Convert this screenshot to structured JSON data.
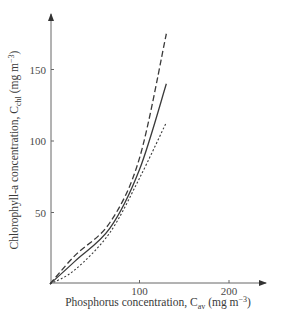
{
  "chart_data": {
    "type": "line",
    "title": "",
    "xlabel": "Phosphorus concentration, C_av (mg m^-3)",
    "ylabel": "Chlorophyll-a concentration, C_chl (mg m^-3)",
    "xlabel_parts": {
      "main": "Phosphorus concentration, C",
      "sub": "av",
      "unit_pre": " (mg m",
      "sup": "−3",
      "unit_post": ")"
    },
    "ylabel_parts": {
      "main": "Chlorophyll-a concentration, C",
      "sub": "chl",
      "unit_pre": " (mg m",
      "sup": "−3",
      "unit_post": ")"
    },
    "xlim": [
      0,
      240
    ],
    "ylim": [
      0,
      190
    ],
    "xticks": [
      100,
      200
    ],
    "yticks": [
      50,
      100,
      150
    ],
    "grid": false,
    "legend": null,
    "x": [
      0,
      28,
      67,
      100,
      130
    ],
    "series": [
      {
        "name": "upper (dashed)",
        "style": "dashed",
        "values": [
          0,
          20,
          43,
          88,
          175
        ]
      },
      {
        "name": "middle (solid)",
        "style": "solid",
        "values": [
          0,
          16,
          39,
          80,
          140
        ]
      },
      {
        "name": "lower (dotted)",
        "style": "dotted",
        "values": [
          0,
          10,
          36,
          74,
          113
        ]
      }
    ],
    "colors": {
      "axis": "#555555",
      "lines": "#3a3a3a"
    }
  }
}
